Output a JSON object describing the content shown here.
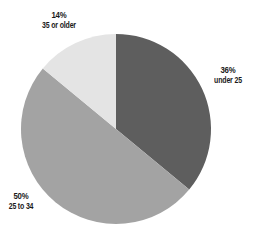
{
  "chart_data": {
    "type": "pie",
    "title": "",
    "categories": [
      "under 25",
      "25 to 34",
      "35 or older"
    ],
    "values": [
      36,
      50,
      14
    ],
    "unit": "%",
    "labels": [
      {
        "pct": "36%",
        "category": "under 25"
      },
      {
        "pct": "50%",
        "category": "25 to 34"
      },
      {
        "pct": "14%",
        "category": "35 or older"
      }
    ],
    "colors": [
      "#5e5e5e",
      "#a3a3a3",
      "#e4e4e4"
    ],
    "start_angle_deg": 0,
    "direction": "clockwise",
    "legend": "none (direct labels)"
  }
}
